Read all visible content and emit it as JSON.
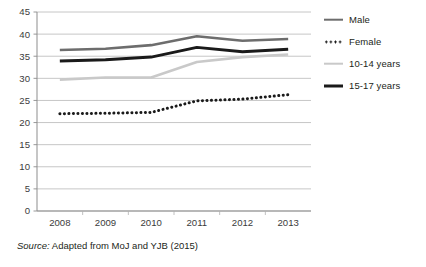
{
  "chart_data": {
    "type": "line",
    "title": "",
    "subtitle": "",
    "xlabel": "",
    "ylabel": "",
    "categories": [
      "2008",
      "2009",
      "2010",
      "2011",
      "2012",
      "2013"
    ],
    "x": [
      2008,
      2009,
      2010,
      2011,
      2012,
      2013
    ],
    "ylim": [
      0,
      45
    ],
    "yticks": [
      0,
      5,
      10,
      15,
      20,
      25,
      30,
      35,
      40,
      45
    ],
    "ytick_labels": [
      "0",
      "5",
      "10",
      "15",
      "20",
      "25",
      "30",
      "35",
      "40",
      "45"
    ],
    "grid": "horizontal",
    "legend_position": "right",
    "series": [
      {
        "name": "Male",
        "style": "solid",
        "color": "#6d6d6d",
        "values": [
          36.4,
          36.7,
          37.5,
          39.5,
          38.5,
          38.9
        ]
      },
      {
        "name": "Female",
        "style": "dotted",
        "color": "#1a1a1a",
        "values": [
          22.0,
          22.1,
          22.3,
          24.9,
          25.3,
          26.3
        ]
      },
      {
        "name": "10-14 years",
        "style": "solid",
        "color": "#c9c9c9",
        "values": [
          29.7,
          30.2,
          30.2,
          33.7,
          34.8,
          35.4
        ]
      },
      {
        "name": "15-17 years",
        "style": "solid",
        "color": "#1a1a1a",
        "values": [
          33.9,
          34.2,
          34.8,
          37.0,
          36.0,
          36.6
        ]
      }
    ]
  },
  "legend": {
    "items": [
      {
        "label": "Male",
        "swatch": "solid-gray-line-icon"
      },
      {
        "label": "Female",
        "swatch": "dotted-black-line-icon"
      },
      {
        "label": "10-14 years",
        "swatch": "solid-lightgray-line-icon"
      },
      {
        "label": "15-17 years",
        "swatch": "solid-black-line-icon"
      }
    ]
  },
  "caption": {
    "label": "Source:",
    "text": " Adapted from MoJ and YJB (2015)"
  }
}
